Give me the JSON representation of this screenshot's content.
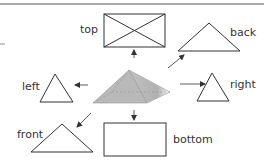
{
  "diagram": {
    "views": {
      "top": "top",
      "back": "back",
      "left": "left",
      "right": "right",
      "front": "front",
      "bottom": "bottom"
    }
  },
  "colors": {
    "stroke": "#333333",
    "pyramid_fill": "#b3b3b3",
    "pyramid_shade": "#9a9a9a",
    "rule": "#555555"
  }
}
